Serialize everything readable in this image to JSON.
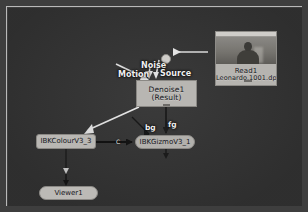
{
  "app": {
    "kind": "node-graph",
    "background_color": "#3c3c3c",
    "frame_border_color": "#b9b9b9"
  },
  "nodes": [
    {
      "id": "read1",
      "name": "Read1",
      "filename": "Leonardo.1001.dpx",
      "type": "Read",
      "has_thumbnail": true
    },
    {
      "id": "denoise1",
      "name": "Denoise1",
      "sublabel": "(Result)",
      "type": "Denoise"
    },
    {
      "id": "ibkcolour",
      "name": "IBKColourV3_3",
      "type": "Gizmo"
    },
    {
      "id": "ibkgizmo",
      "name": "IBKGizmoV3_1",
      "type": "Gizmo"
    },
    {
      "id": "viewer1",
      "name": "Viewer1",
      "type": "Viewer"
    }
  ],
  "node_labels": {
    "read1_title": "Read1",
    "read1_file": "Leonardo.1001.dpx",
    "denoise1_title": "Denoise1",
    "denoise1_sub": "(Result)",
    "ibkcolour_title": "IBKColourV3_3",
    "ibkgizmo_title": "IBKGizmoV3_1",
    "viewer1_title": "Viewer1"
  },
  "connection_labels": {
    "motion": "Motion",
    "noise": "Noise",
    "source": "Source",
    "bg": "bg",
    "fg": "fg",
    "c": "C"
  },
  "connections": [
    {
      "from": "read1",
      "to": "denoise1",
      "input": "Source"
    },
    {
      "from": "denoise1",
      "to": "ibkcolour",
      "input": ""
    },
    {
      "from": "denoise1",
      "to": "ibkgizmo",
      "input": "fg"
    },
    {
      "from": "ibkcolour",
      "to": "ibkgizmo",
      "input": "C"
    },
    {
      "from": "ibkcolour",
      "to": "viewer1",
      "input": ""
    }
  ],
  "colors": {
    "node_fill": "#b4b2ae",
    "node_border": "#8d8b87",
    "wire": "#e8e8e8",
    "wire_dark": "#111111",
    "canvas": "#3c3c3c"
  }
}
